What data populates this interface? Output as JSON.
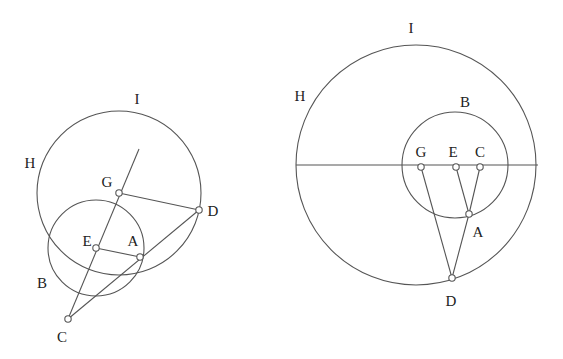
{
  "figures": [
    {
      "id": "left",
      "circles": [
        {
          "name": "large-circle",
          "cx": 119,
          "cy": 193,
          "r": 82
        },
        {
          "name": "small-circle",
          "cx": 96,
          "cy": 248,
          "r": 48
        }
      ],
      "segments": [
        {
          "name": "line-c-through-e-g",
          "x1": 68,
          "y1": 319,
          "x2": 139,
          "y2": 149
        },
        {
          "name": "segment-c-d",
          "x1": 68,
          "y1": 319,
          "x2": 199,
          "y2": 210
        },
        {
          "name": "segment-g-d",
          "x1": 119,
          "y1": 193,
          "x2": 199,
          "y2": 210
        },
        {
          "name": "segment-e-a",
          "x1": 96,
          "y1": 248,
          "x2": 140,
          "y2": 257
        }
      ],
      "points": [
        {
          "name": "G",
          "x": 119,
          "y": 193
        },
        {
          "name": "D",
          "x": 199,
          "y": 210
        },
        {
          "name": "E",
          "x": 96,
          "y": 248
        },
        {
          "name": "A",
          "x": 140,
          "y": 257
        },
        {
          "name": "C",
          "x": 68,
          "y": 319
        }
      ],
      "labels": [
        {
          "text": "I",
          "x": 137,
          "y": 104
        },
        {
          "text": "H",
          "x": 30,
          "y": 168
        },
        {
          "text": "G",
          "x": 107,
          "y": 187
        },
        {
          "text": "D",
          "x": 213,
          "y": 216
        },
        {
          "text": "E",
          "x": 87,
          "y": 246
        },
        {
          "text": "A",
          "x": 133,
          "y": 246
        },
        {
          "text": "B",
          "x": 42,
          "y": 288
        },
        {
          "text": "C",
          "x": 62,
          "y": 342
        }
      ]
    },
    {
      "id": "right",
      "circles": [
        {
          "name": "large-circle",
          "cx": 416,
          "cy": 165,
          "r": 120
        },
        {
          "name": "small-circle",
          "cx": 455,
          "cy": 165,
          "r": 53
        }
      ],
      "segments": [
        {
          "name": "diameter-line",
          "x1": 296,
          "y1": 165,
          "x2": 538,
          "y2": 165
        },
        {
          "name": "segment-g-d",
          "x1": 421,
          "y1": 167,
          "x2": 452,
          "y2": 278
        },
        {
          "name": "segment-e-a",
          "x1": 456,
          "y1": 167,
          "x2": 469,
          "y2": 214
        },
        {
          "name": "segment-c-a",
          "x1": 480,
          "y1": 167,
          "x2": 469,
          "y2": 214
        },
        {
          "name": "segment-a-d",
          "x1": 469,
          "y1": 214,
          "x2": 452,
          "y2": 278
        }
      ],
      "points": [
        {
          "name": "G",
          "x": 421,
          "y": 167
        },
        {
          "name": "E",
          "x": 456,
          "y": 167
        },
        {
          "name": "C",
          "x": 480,
          "y": 167
        },
        {
          "name": "A",
          "x": 469,
          "y": 214
        },
        {
          "name": "D",
          "x": 452,
          "y": 278
        }
      ],
      "labels": [
        {
          "text": "I",
          "x": 411,
          "y": 33
        },
        {
          "text": "H",
          "x": 300,
          "y": 101
        },
        {
          "text": "B",
          "x": 465,
          "y": 107
        },
        {
          "text": "G",
          "x": 421,
          "y": 157
        },
        {
          "text": "E",
          "x": 453,
          "y": 157
        },
        {
          "text": "C",
          "x": 480,
          "y": 157
        },
        {
          "text": "A",
          "x": 478,
          "y": 237
        },
        {
          "text": "D",
          "x": 451,
          "y": 306
        }
      ]
    }
  ]
}
